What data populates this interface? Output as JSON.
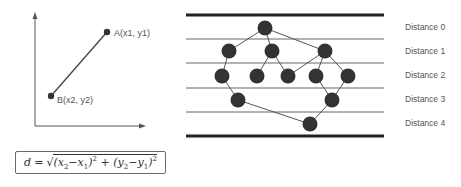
{
  "left_panel": {
    "point_a_label": "A(x1, y1)",
    "point_b_label": "B(x2, y2)",
    "formula": {
      "lhs": "d",
      "eq": "=",
      "sqrt": "√",
      "term1": "(x",
      "term1_sub2": "2",
      "term1_minus": "−x",
      "term1_sub1": "1",
      "term1_close": ")",
      "term1_sup": "2",
      "plus": " + ",
      "term2": "(y",
      "term2_sub2": "2",
      "term2_minus": "−y",
      "term2_sub1": "1",
      "term2_close": ")",
      "term2_sup": "2"
    }
  },
  "right_panel": {
    "distance_labels": [
      "Distance 0",
      "Distance 1",
      "Distance 2",
      "Distance 3",
      "Distance 4"
    ]
  },
  "colors": {
    "node": "#333333",
    "line": "#555555",
    "text": "#555555"
  }
}
